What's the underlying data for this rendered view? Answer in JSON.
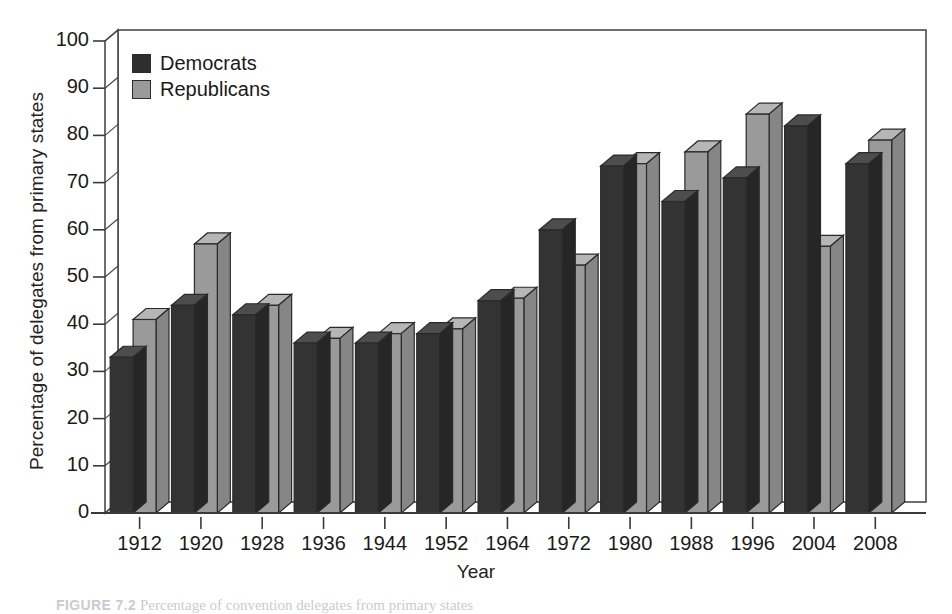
{
  "figure": {
    "caption_label": "FIGURE 7.2",
    "caption_text": "Percentage of convention delegates from primary states"
  },
  "legend": {
    "position": "inside-top-left",
    "entries": [
      {
        "label": "Democrats",
        "color": "#2e2e2e"
      },
      {
        "label": "Republicans",
        "color": "#9a9a9a"
      }
    ]
  },
  "chart_data": {
    "type": "bar",
    "title": "",
    "subtitle": "",
    "xlabel": "Year",
    "ylabel": "Percentage of delegates from primary states",
    "ylim": [
      0,
      100
    ],
    "ytick_labels": [
      "0",
      "10",
      "20",
      "30",
      "40",
      "50",
      "60",
      "70",
      "80",
      "90",
      "100"
    ],
    "yticks": [
      0,
      10,
      20,
      30,
      40,
      50,
      60,
      70,
      80,
      90,
      100
    ],
    "grid": false,
    "three_d": true,
    "categories": [
      "1912",
      "1920",
      "1928",
      "1936",
      "1944",
      "1952",
      "1964",
      "1972",
      "1980",
      "1988",
      "1996",
      "2004",
      "2008"
    ],
    "series": [
      {
        "name": "Democrats",
        "color": "#2e2e2e",
        "values": [
          33,
          44,
          42,
          36,
          36,
          38,
          45,
          60,
          73.5,
          66,
          71,
          82,
          74
        ]
      },
      {
        "name": "Republicans",
        "color": "#9a9a9a",
        "values": [
          41,
          57,
          44,
          37,
          38,
          39,
          45.5,
          52.5,
          74,
          76.5,
          84.5,
          56.5,
          79
        ]
      }
    ]
  }
}
